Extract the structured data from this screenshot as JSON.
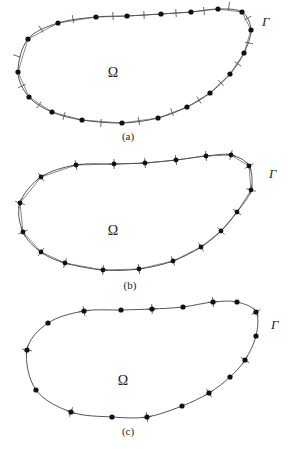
{
  "figures": [
    {
      "id": "a",
      "caption": "(a)",
      "domain_label": "Ω",
      "boundary_label": "Γ",
      "caption_pos": [
        128,
        140
      ],
      "domain_pos": [
        113,
        77
      ],
      "boundary_pos": [
        262,
        26
      ],
      "nodes": [
        [
          58,
          23
        ],
        [
          96,
          17
        ],
        [
          127,
          16
        ],
        [
          161,
          14
        ],
        [
          191,
          12
        ],
        [
          218,
          9
        ],
        [
          242,
          12
        ],
        [
          251,
          30
        ],
        [
          244,
          53
        ],
        [
          230,
          74
        ],
        [
          210,
          93
        ],
        [
          187,
          107
        ],
        [
          158,
          118
        ],
        [
          122,
          123
        ],
        [
          82,
          120
        ],
        [
          52,
          112
        ],
        [
          29,
          97
        ],
        [
          18,
          72
        ],
        [
          28,
          39
        ]
      ],
      "ticks": [
        [
          41,
          29
        ],
        [
          73,
          19
        ],
        [
          113,
          16
        ],
        [
          144,
          15
        ],
        [
          176,
          13
        ],
        [
          204,
          11
        ],
        [
          229,
          6
        ],
        [
          248,
          18
        ],
        [
          249,
          43
        ],
        [
          238,
          64
        ],
        [
          221,
          83
        ],
        [
          199,
          100
        ],
        [
          172,
          112
        ],
        [
          139,
          121
        ],
        [
          101,
          123
        ],
        [
          64,
          116
        ],
        [
          39,
          105
        ],
        [
          22,
          86
        ],
        [
          17,
          56
        ]
      ],
      "node_style": "dot",
      "tick_style": "bar"
    },
    {
      "id": "b",
      "caption": "(b)",
      "domain_label": "Ω",
      "boundary_label": "Γ",
      "caption_pos": [
        130,
        289
      ],
      "domain_pos": [
        113,
        235
      ],
      "boundary_pos": [
        269,
        178
      ],
      "nodes": [
        [
          41,
          177
        ],
        [
          76,
          165
        ],
        [
          114,
          164
        ],
        [
          145,
          163
        ],
        [
          176,
          160
        ],
        [
          206,
          156
        ],
        [
          231,
          155
        ],
        [
          249,
          166
        ],
        [
          251,
          190
        ],
        [
          237,
          212
        ],
        [
          221,
          231
        ],
        [
          201,
          247
        ],
        [
          173,
          261
        ],
        [
          139,
          269
        ],
        [
          103,
          270
        ],
        [
          65,
          263
        ],
        [
          41,
          252
        ],
        [
          23,
          232
        ],
        [
          20,
          203
        ]
      ],
      "ticks": [],
      "node_style": "cross",
      "tick_style": "none"
    },
    {
      "id": "c",
      "caption": "(c)",
      "domain_label": "Ω",
      "boundary_label": "Γ",
      "caption_pos": [
        128,
        435
      ],
      "domain_pos": [
        123,
        385
      ],
      "boundary_pos": [
        271,
        329
      ],
      "nodes": [
        [
          48,
          323
        ],
        [
          84,
          311
        ],
        [
          121,
          310
        ],
        [
          152,
          309
        ],
        [
          183,
          307
        ],
        [
          213,
          302
        ],
        [
          237,
          302
        ],
        [
          256,
          312
        ],
        [
          256,
          336
        ],
        [
          245,
          360
        ],
        [
          230,
          377
        ],
        [
          209,
          393
        ],
        [
          182,
          406
        ],
        [
          147,
          417
        ],
        [
          112,
          417
        ],
        [
          71,
          412
        ],
        [
          36,
          390
        ],
        [
          27,
          350
        ]
      ],
      "crossed_nodes": [
        1,
        3,
        5,
        7,
        9,
        11,
        13,
        15,
        17
      ],
      "ticks": [],
      "node_style": "dot",
      "tick_style": "cross-subset"
    }
  ],
  "colors": {
    "curve": "#555555",
    "node": "#111111",
    "tick": "#444444",
    "text": "#222222"
  }
}
